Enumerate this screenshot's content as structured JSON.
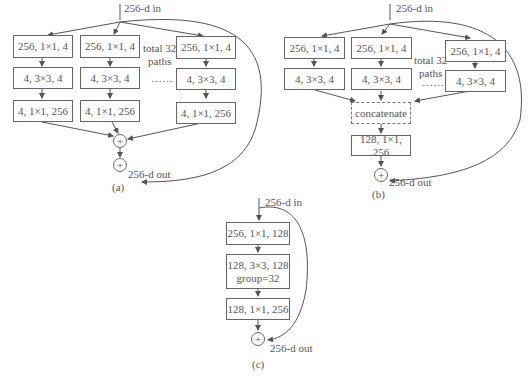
{
  "panel_a": {
    "input_label": "256-d in",
    "output_label": "256-d out",
    "caption": "(a)",
    "paths_note": "total 32\npaths",
    "ellipsis": "……",
    "columns": [
      {
        "b1": "256, 1×1, 4",
        "b2": "4, 3×3, 4",
        "b3": "4, 1×1, 256"
      },
      {
        "b1": "256, 1×1, 4",
        "b2": "4, 3×3, 4",
        "b3": "4, 1×1, 256"
      },
      {
        "b1": "256, 1×1, 4",
        "b2": "4, 3×3, 4",
        "b3": "4, 1×1, 256"
      }
    ],
    "plus": "+"
  },
  "panel_b": {
    "input_label": "256-d in",
    "output_label": "256-d out",
    "caption": "(b)",
    "paths_note": "total 32\npaths",
    "ellipsis": "……",
    "columns": [
      {
        "b1": "256, 1×1, 4",
        "b2": "4, 3×3, 4"
      },
      {
        "b1": "256, 1×1, 4",
        "b2": "4, 3×3, 4"
      },
      {
        "b1": "256, 1×1, 4",
        "b2": "4, 3×3, 4"
      }
    ],
    "concat": "concatenate",
    "final": "128, 1×1, 256",
    "plus": "+"
  },
  "panel_c": {
    "input_label": "256-d in",
    "output_label": "256-d out",
    "caption": "(c)",
    "b1": "256, 1×1, 128",
    "b2_line1": "128, 3×3, 128",
    "b2_line2": "group=32",
    "b3": "128, 1×1, 256",
    "plus": "+"
  }
}
